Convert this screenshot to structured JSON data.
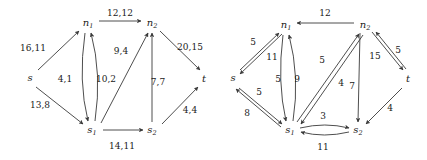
{
  "figure": {
    "type": "diagram",
    "stroke_color": "#3a3a3a",
    "text_color": "#1a1a1a",
    "background": "#ffffff"
  },
  "graphs": [
    {
      "id": "left-graph",
      "name": "flow-network-left",
      "nodes": [
        {
          "id": "s",
          "label": "s",
          "sub": "",
          "x": 30,
          "y": 78
        },
        {
          "id": "n1",
          "label": "n",
          "sub": "1",
          "x": 88,
          "y": 23
        },
        {
          "id": "n2",
          "label": "n",
          "sub": "2",
          "x": 152,
          "y": 23
        },
        {
          "id": "t",
          "label": "t",
          "sub": "",
          "x": 204,
          "y": 79
        },
        {
          "id": "s1",
          "label": "s",
          "sub": "1",
          "x": 92,
          "y": 130
        },
        {
          "id": "s2",
          "label": "s",
          "sub": "2",
          "x": 152,
          "y": 130
        }
      ],
      "edges": [
        {
          "from": "s",
          "to": "n1",
          "label": "16,11",
          "lx": 33,
          "ly": 48
        },
        {
          "from": "s",
          "to": "s1",
          "label": "13,8",
          "lx": 40,
          "ly": 105
        },
        {
          "from": "n1",
          "to": "n2",
          "label": "12,12",
          "lx": 120,
          "ly": 13
        },
        {
          "from": "n1",
          "to": "s1",
          "label": "4,1",
          "lx": 65,
          "ly": 79
        },
        {
          "from": "s1",
          "to": "n1",
          "label": "10,2",
          "lx": 105,
          "ly": 79
        },
        {
          "from": "s1",
          "to": "n2",
          "label": "9,4",
          "lx": 120,
          "ly": 51
        },
        {
          "from": "s1",
          "to": "s2",
          "label": "14,11",
          "lx": 122,
          "ly": 146
        },
        {
          "from": "s2",
          "to": "n2",
          "label": "7,7",
          "lx": 157,
          "ly": 82
        },
        {
          "from": "s2",
          "to": "t",
          "label": "4,4",
          "lx": 190,
          "ly": 110
        },
        {
          "from": "n2",
          "to": "t",
          "label": "20,15",
          "lx": 190,
          "ly": 47
        }
      ]
    },
    {
      "id": "right-graph",
      "name": "residual-network-right",
      "nodes": [
        {
          "id": "s",
          "label": "s",
          "sub": "",
          "x": 233,
          "y": 78
        },
        {
          "id": "n1",
          "label": "n",
          "sub": "1",
          "x": 286,
          "y": 25
        },
        {
          "id": "n2",
          "label": "n",
          "sub": "2",
          "x": 365,
          "y": 25
        },
        {
          "id": "t",
          "label": "t",
          "sub": "",
          "x": 408,
          "y": 79
        },
        {
          "id": "s1",
          "label": "s",
          "sub": "1",
          "x": 290,
          "y": 130
        },
        {
          "id": "s2",
          "label": "s",
          "sub": "2",
          "x": 358,
          "y": 130
        }
      ],
      "edges": [
        {
          "from": "s",
          "to": "n1",
          "label": "5",
          "lx": 253,
          "ly": 42
        },
        {
          "from": "n1",
          "to": "s",
          "label": "11",
          "lx": 271,
          "ly": 57
        },
        {
          "from": "s",
          "to": "s1",
          "label": "5",
          "lx": 258,
          "ly": 92
        },
        {
          "from": "s1",
          "to": "s",
          "label": "8",
          "lx": 247,
          "ly": 113
        },
        {
          "from": "n2",
          "to": "n1",
          "label": "12",
          "lx": 325,
          "ly": 14
        },
        {
          "from": "n1",
          "to": "s1",
          "label": "5",
          "lx": 278,
          "ly": 79
        },
        {
          "from": "s1",
          "to": "n1",
          "label": "9",
          "lx": 296,
          "ly": 79
        },
        {
          "from": "s1",
          "to": "n2",
          "label": "5",
          "lx": 322,
          "ly": 60
        },
        {
          "from": "n2",
          "to": "s1",
          "label": "4",
          "lx": 340,
          "ly": 83
        },
        {
          "from": "n2",
          "to": "s2",
          "label": "7",
          "lx": 358,
          "ly": 86
        },
        {
          "from": "n2",
          "to": "t",
          "label": "15",
          "lx": 374,
          "ly": 56
        },
        {
          "from": "t",
          "to": "n2",
          "label": "5",
          "lx": 396,
          "ly": 50
        },
        {
          "from": "t",
          "to": "s2",
          "label": "4",
          "lx": 390,
          "ly": 108
        },
        {
          "from": "s1",
          "to": "s2",
          "label": "3",
          "lx": 322,
          "ly": 117
        },
        {
          "from": "s2",
          "to": "s1",
          "label": "11",
          "lx": 322,
          "ly": 146
        }
      ]
    }
  ]
}
